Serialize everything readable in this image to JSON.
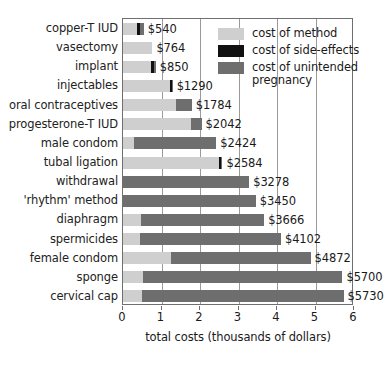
{
  "chart_data": {
    "type": "bar",
    "orientation": "horizontal",
    "stacked": true,
    "title": "",
    "xlabel": "total costs (thousands of dollars)",
    "ylabel": "",
    "xlim": [
      0,
      6
    ],
    "xticks": [
      0,
      1,
      2,
      3,
      4,
      5,
      6
    ],
    "xticklabels": [
      "0",
      "1",
      "2",
      "3",
      "4",
      "5",
      "6"
    ],
    "grid": "vertical",
    "legend_position": "upper right (inside plot)",
    "legend": [
      {
        "key": "method",
        "label": "cost of method",
        "color": "#cfcfcf"
      },
      {
        "key": "side_effects",
        "label": "cost of side-effects",
        "color": "#111111"
      },
      {
        "key": "unintended_pregnancy",
        "label": "cost of unintended pregnancy",
        "color": "#6e6e6e"
      }
    ],
    "categories": [
      "copper-T IUD",
      "vasectomy",
      "implant",
      "injectables",
      "oral contraceptives",
      "progesterone-T IUD",
      "male condom",
      "tubal ligation",
      "withdrawal",
      "'rhythm' method",
      "diaphragm",
      "spermicides",
      "female condom",
      "sponge",
      "cervical cap"
    ],
    "series": [
      {
        "name": "cost of method",
        "values": [
          370,
          764,
          740,
          1215,
          1370,
          1760,
          290,
          2490,
          0,
          0,
          460,
          440,
          1250,
          530,
          500
        ]
      },
      {
        "name": "cost of side-effects",
        "values": [
          60,
          0,
          60,
          50,
          0,
          0,
          0,
          60,
          0,
          0,
          0,
          0,
          0,
          0,
          0
        ]
      },
      {
        "name": "cost of unintended pregnancy",
        "values": [
          110,
          0,
          50,
          25,
          414,
          282,
          2134,
          34,
          3278,
          3450,
          3206,
          3662,
          3622,
          5170,
          5230
        ]
      }
    ],
    "totals": [
      540,
      764,
      850,
      1290,
      1784,
      2042,
      2424,
      2584,
      3278,
      3450,
      3666,
      4102,
      4872,
      5700,
      5730
    ],
    "value_labels": [
      "$540",
      "$764",
      "$850",
      "$1290",
      "$1784",
      "$2042",
      "$2424",
      "$2584",
      "$3278",
      "$3450",
      "$3666",
      "$4102",
      "$4872",
      "$5700",
      "$5730"
    ]
  }
}
